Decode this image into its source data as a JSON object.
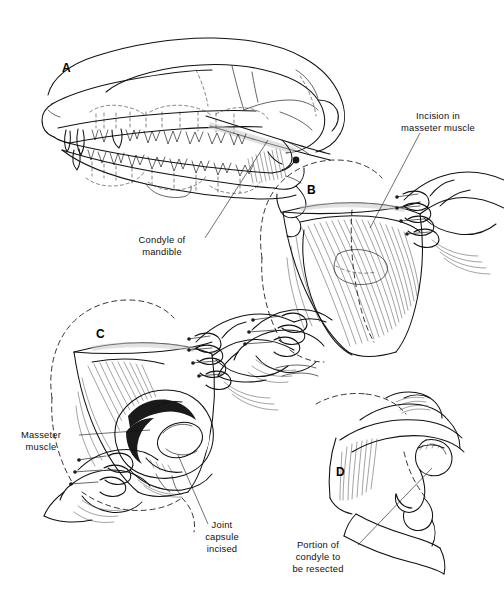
{
  "figure": {
    "background_color": "#ffffff",
    "ink_color": "#111111",
    "style": "black-and-white line drawing, medical illustration"
  },
  "panels": [
    {
      "id": "A",
      "letter": "A",
      "subject": "Lateral view of canine skull with mandible, dentition and zygomatic arch",
      "letter_pos": {
        "x": 62,
        "y": 72
      }
    },
    {
      "id": "B",
      "letter": "B",
      "subject": "Surgical field: skin retracted, masseter muscle exposed with incision line, two hand-held retractors",
      "letter_pos": {
        "x": 307,
        "y": 194
      }
    },
    {
      "id": "C",
      "letter": "C",
      "subject": "Deeper dissection: masseter muscle reflected, joint capsule incised exposing condyle",
      "letter_pos": {
        "x": 96,
        "y": 338
      }
    },
    {
      "id": "D",
      "letter": "D",
      "subject": "Close-up of mandibular condyle and ramus with dashed resection line",
      "letter_pos": {
        "x": 336,
        "y": 476
      }
    }
  ],
  "labels": [
    {
      "id": "condyle-of-mandible",
      "lines": [
        "Condyle of",
        "mandible"
      ],
      "anchor": "middle",
      "x": 162,
      "y": 243,
      "leader": {
        "from": [
          205,
          238
        ],
        "to": [
          268,
          140
        ]
      }
    },
    {
      "id": "incision-in-masseter-muscle",
      "lines": [
        "Incision in",
        "masseter muscle"
      ],
      "anchor": "middle",
      "x": 438,
      "y": 119,
      "leader": {
        "from": [
          420,
          133
        ],
        "to": [
          370,
          228
        ]
      }
    },
    {
      "id": "masseter-muscle",
      "lines": [
        "Masseter",
        "muscle"
      ],
      "anchor": "middle",
      "x": 41,
      "y": 438,
      "leader": {
        "from": [
          79,
          435
        ],
        "to": [
          150,
          430
        ]
      }
    },
    {
      "id": "joint-capsule-incised",
      "lines": [
        "Joint",
        "capsule",
        "incised"
      ],
      "anchor": "middle",
      "x": 222,
      "y": 528,
      "leader": {
        "from": [
          208,
          524
        ],
        "to": [
          178,
          455
        ]
      }
    },
    {
      "id": "portion-of-condyle-to-be-resected",
      "lines": [
        "Portion of",
        "condyle to",
        "be resected"
      ],
      "anchor": "middle",
      "x": 318,
      "y": 548,
      "leader": {
        "from": [
          358,
          545
        ],
        "to": [
          432,
          468
        ]
      }
    }
  ]
}
